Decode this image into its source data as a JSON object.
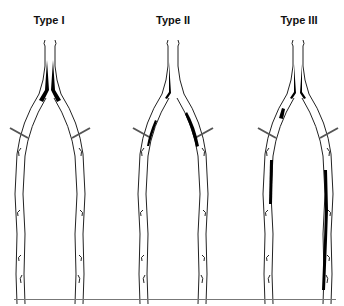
{
  "figure": {
    "panels": [
      {
        "label": "Type I",
        "description": "Occlusion at aortic bifurcation / proximal common iliac arteries"
      },
      {
        "label": "Type II",
        "description": "Aortoiliac disease extending into iliac arteries"
      },
      {
        "label": "Type III",
        "description": "Multilevel disease extending into femoropopliteal arteries"
      }
    ],
    "colors": {
      "lesion": "#000000",
      "vessel_outline": "#222222",
      "background": "#ffffff",
      "rule": "#777777"
    }
  }
}
